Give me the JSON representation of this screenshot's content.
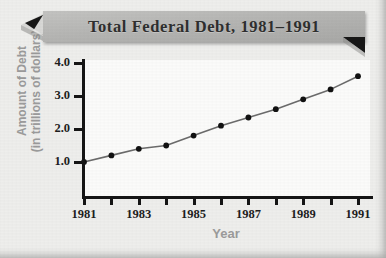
{
  "figure": {
    "title": "Total Federal Debt, 1981–1991",
    "paper_color": "#eeeeec",
    "plot_bg_color": "#fbfbfa",
    "banner_color": "#b3b3b3",
    "axis_color": "#151515",
    "axis_title_color": "#9b9b9b",
    "series_color": "#6b6b6b",
    "marker_color": "#111111"
  },
  "chart_data": {
    "type": "line",
    "title": "Total Federal Debt, 1981–1991",
    "subtitle": "",
    "xlabel": "Year",
    "ylabel": "Amount of Debt (in trillions of dollars)",
    "ylabel_line1": "Amount of Debt",
    "ylabel_line2": "(in trillions of dollars)",
    "x": [
      1981,
      1982,
      1983,
      1984,
      1985,
      1986,
      1987,
      1988,
      1989,
      1990,
      1991
    ],
    "values": [
      1.0,
      1.2,
      1.4,
      1.5,
      1.8,
      2.1,
      2.35,
      2.6,
      2.9,
      3.2,
      3.6
    ],
    "xlim": [
      1981,
      1991
    ],
    "ylim": [
      0.0,
      4.0
    ],
    "ytick_values": [
      1.0,
      2.0,
      3.0,
      4.0
    ],
    "ytick_labels": [
      "1.0",
      "2.0",
      "3.0",
      "4.0"
    ],
    "xtick_values": [
      1981,
      1982,
      1983,
      1984,
      1985,
      1986,
      1987,
      1988,
      1989,
      1990,
      1991
    ],
    "xtick_labels": [
      "1981",
      "",
      "1983",
      "",
      "1985",
      "",
      "1987",
      "",
      "1989",
      "",
      "1991"
    ],
    "grid": false,
    "legend": false,
    "legend_position": "none",
    "markers": true,
    "annotations": []
  }
}
